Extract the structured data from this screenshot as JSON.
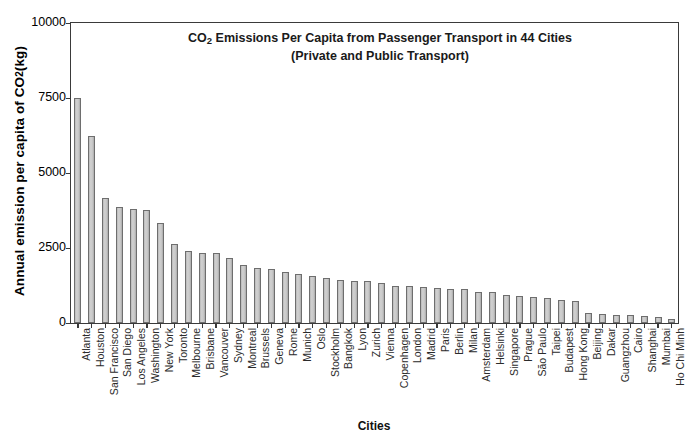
{
  "chart_data": {
    "type": "bar",
    "title": "CO2  Emissions Per Capita from Passenger Transport in 44 Cities",
    "title_line1_pre": "CO",
    "title_line1_sub": "2",
    "title_line1_post": "  Emissions Per Capita from Passenger Transport in 44 Cities",
    "subtitle": "(Private and Public Transport)",
    "xlabel": "Cities",
    "ylabel_pre": "Annual emission per capita of CO",
    "ylabel_sub": "2",
    "ylabel_post": " (kg)",
    "ylabel": "Annual emission per capita of CO2 (kg)",
    "ylim": [
      0,
      10000
    ],
    "yticks": [
      10000,
      7500,
      5000,
      2500,
      0
    ],
    "ytick_labels": [
      "10000",
      "7500",
      "5000",
      "2500",
      "0"
    ],
    "grid": false,
    "legend": "none",
    "bar_color": "#c4c4c4",
    "bar_edge_color": "#6e6e6e",
    "axis_color": "#3a3a3a",
    "categories": [
      "Atlanta",
      "Houston",
      "San Francisco",
      "San Diego",
      "Los Angeles",
      "Washington",
      "New York",
      "Toronto",
      "Melbourne",
      "Brisbane",
      "Vancouver",
      "Sydney",
      "Montreal",
      "Brussels",
      "Geneva",
      "Rome",
      "Munich",
      "Oslo",
      "Stockholm",
      "Bangkok",
      "Lyon",
      "Zurich",
      "Vienna",
      "Copenhagen",
      "London",
      "Madrid",
      "Paris",
      "Berlin",
      "Milan",
      "Amsterdam",
      "Helsinki",
      "Singapore",
      "Prague",
      "São Paulo",
      "Taipei",
      "Budapest",
      "Hong Kong",
      "Beijing",
      "Dakar",
      "Guangzhou",
      "Cairo",
      "Shanghai",
      "Mumbai",
      "Ho Chi Minh"
    ],
    "values": [
      7500,
      6220,
      4180,
      3870,
      3790,
      3780,
      3350,
      2620,
      2400,
      2350,
      2330,
      2180,
      1920,
      1820,
      1790,
      1700,
      1620,
      1560,
      1510,
      1440,
      1400,
      1390,
      1320,
      1250,
      1230,
      1200,
      1180,
      1140,
      1130,
      1050,
      1030,
      950,
      900,
      870,
      840,
      760,
      720,
      350,
      300,
      280,
      270,
      250,
      210,
      150
    ]
  }
}
